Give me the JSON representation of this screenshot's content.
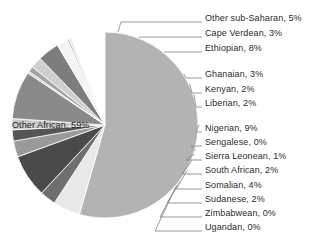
{
  "chart_data": {
    "type": "pie",
    "title": "",
    "subtitle": "",
    "xlabel": "",
    "ylabel": "",
    "legend_position": "callout-labels-right",
    "grid": false,
    "start_angle_deg": -90,
    "direction": "clockwise",
    "categories": [
      "Other African",
      "Other sub-Saharan",
      "Cape Verdean",
      "Ethiopian",
      "Ghanaian",
      "Kenyan",
      "Liberian",
      "Nigerian",
      "Sengalese",
      "Sierra Leonean",
      "South African",
      "Somalian",
      "Sudanese",
      "Zimbabwean",
      "Ugandan"
    ],
    "values": [
      59,
      5,
      3,
      8,
      3,
      2,
      2,
      9,
      0,
      1,
      2,
      4,
      2,
      0,
      0
    ],
    "slices": [
      {
        "label": "Other African",
        "value": 59,
        "display": "Other African, 59%",
        "color": "#b3b3b3",
        "sweep_deg": 196.0
      },
      {
        "label": "Other sub-Saharan",
        "value": 5,
        "display": "Other sub-Saharan, 5%",
        "color": "#e9e9e9",
        "sweep_deg": 17.0
      },
      {
        "label": "Cape Verdean",
        "value": 3,
        "display": "Cape Verdean, 3%",
        "color": "#6f6f6f",
        "sweep_deg": 10.0
      },
      {
        "label": "Ethiopian",
        "value": 8,
        "display": "Ethiopian, 8%",
        "color": "#4a4a4a",
        "sweep_deg": 27.0
      },
      {
        "label": "Ghanaian",
        "value": 3,
        "display": "Ghanaian, 3%",
        "color": "#9a9a9a",
        "sweep_deg": 10.0
      },
      {
        "label": "Kenyan",
        "value": 2,
        "display": "Kenyan, 2%",
        "color": "#555555",
        "sweep_deg": 7.0
      },
      {
        "label": "Liberian",
        "value": 2,
        "display": "Liberian, 2%",
        "color": "#c9c9c9",
        "sweep_deg": 7.0
      },
      {
        "label": "Nigerian",
        "value": 9,
        "display": "Nigerian, 9%",
        "color": "#8a8a8a",
        "sweep_deg": 30.0
      },
      {
        "label": "Sengalese",
        "value": 0,
        "display": "Sengalese, 0%",
        "color": "#d2d2d2",
        "sweep_deg": 1.2
      },
      {
        "label": "Sierra Leonean",
        "value": 1,
        "display": "Sierra Leonean, 1%",
        "color": "#a5a5a5",
        "sweep_deg": 3.5
      },
      {
        "label": "South African",
        "value": 2,
        "display": "South African, 2%",
        "color": "#cfcfcf",
        "sweep_deg": 7.0
      },
      {
        "label": "Somalian",
        "value": 4,
        "display": "Somalian, 4%",
        "color": "#7d7d7d",
        "sweep_deg": 13.5
      },
      {
        "label": "Sudanese",
        "value": 2,
        "display": "Sudanese, 2%",
        "color": "#f4f4f4",
        "sweep_deg": 7.0
      },
      {
        "label": "Zimbabwean",
        "value": 0,
        "display": "Zimbabwean, 0%",
        "color": "#bdbdbd",
        "sweep_deg": 1.2
      },
      {
        "label": "Ugandan",
        "value": 0,
        "display": "Ugandan, 0%",
        "color": "#e0e0e0",
        "sweep_deg": 1.2
      }
    ],
    "inner_label": {
      "text": "Other African, 59%"
    },
    "callouts": [
      {
        "text": "Other sub-Saharan, 5%"
      },
      {
        "text": "Cape Verdean, 3%"
      },
      {
        "text": "Ethiopian, 8%"
      },
      {
        "text": "Ghanaian, 3%"
      },
      {
        "text": "Kenyan, 2%"
      },
      {
        "text": "Liberian, 2%"
      },
      {
        "text": "Nigerian, 9%"
      },
      {
        "text": "Sengalese, 0%"
      },
      {
        "text": "Sierra Leonean, 1%"
      },
      {
        "text": "South African, 2%"
      },
      {
        "text": "Somalian, 4%"
      },
      {
        "text": "Sudanese, 2%"
      },
      {
        "text": "Zimbabwean, 0%"
      },
      {
        "text": "Ugandan, 0%"
      }
    ]
  },
  "style": {
    "background": "#ffffff",
    "text_color": "#2b2b2b",
    "leader_color": "#8c8c8c",
    "slice_outline": "#ffffff"
  }
}
